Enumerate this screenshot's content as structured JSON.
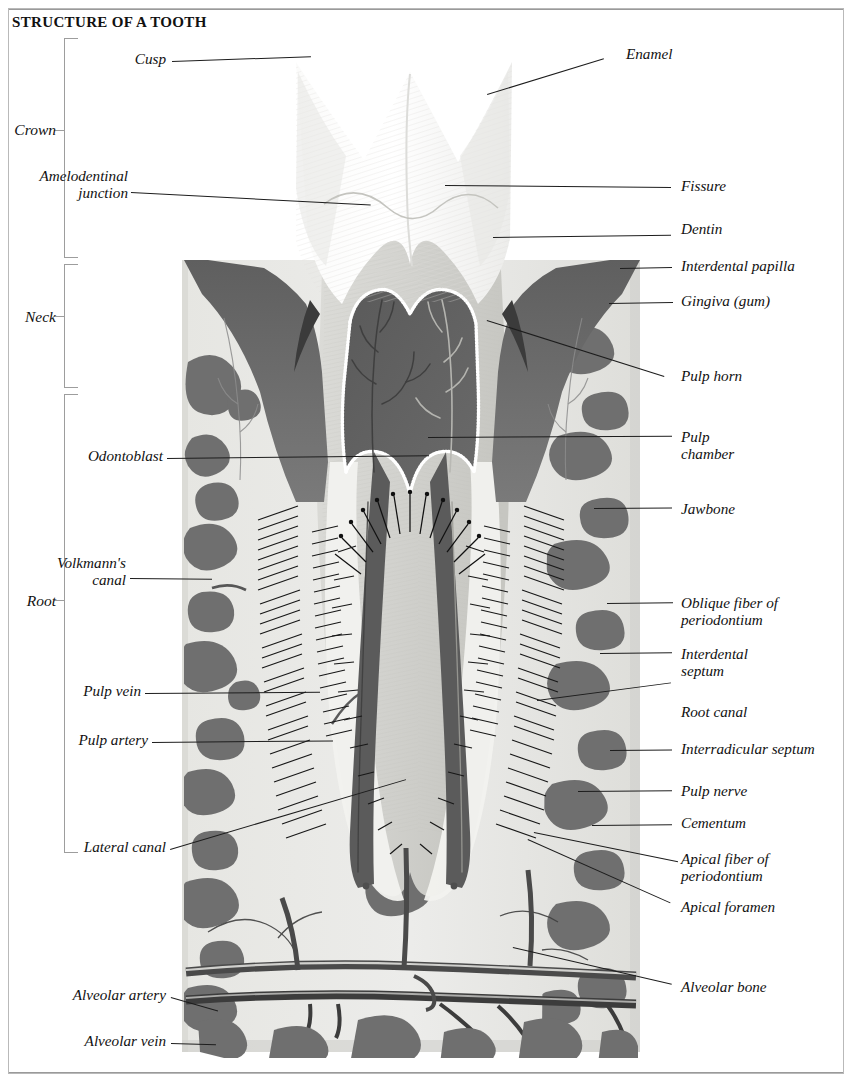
{
  "title": "STRUCTURE OF A TOOTH",
  "regions": [
    {
      "name": "region-crown",
      "label": "Crown"
    },
    {
      "name": "region-neck",
      "label": "Neck"
    },
    {
      "name": "region-root",
      "label": "Root"
    }
  ],
  "labels_left": [
    {
      "name": "label-cusp",
      "text": "Cusp"
    },
    {
      "name": "label-amelodentinal-junction",
      "text": "Amelodentinal",
      "text2": "junction"
    },
    {
      "name": "label-odontoblast",
      "text": "Odontoblast"
    },
    {
      "name": "label-volkmanns-canal",
      "text": "Volkmann's",
      "text2": "canal"
    },
    {
      "name": "label-pulp-vein",
      "text": "Pulp vein"
    },
    {
      "name": "label-pulp-artery",
      "text": "Pulp artery"
    },
    {
      "name": "label-lateral-canal",
      "text": "Lateral canal"
    },
    {
      "name": "label-alveolar-artery",
      "text": "Alveolar artery"
    },
    {
      "name": "label-alveolar-vein",
      "text": "Alveolar vein"
    }
  ],
  "labels_right": [
    {
      "name": "label-enamel",
      "text": "Enamel"
    },
    {
      "name": "label-fissure",
      "text": "Fissure"
    },
    {
      "name": "label-dentin",
      "text": "Dentin"
    },
    {
      "name": "label-interdental-papilla",
      "text": "Interdental papilla"
    },
    {
      "name": "label-gingiva",
      "text": "Gingiva (gum)"
    },
    {
      "name": "label-pulp-horn",
      "text": "Pulp horn"
    },
    {
      "name": "label-pulp-chamber",
      "text": "Pulp",
      "text2": "chamber"
    },
    {
      "name": "label-jawbone",
      "text": "Jawbone"
    },
    {
      "name": "label-oblique-fiber",
      "text": "Oblique fiber of",
      "text2": "periodontium"
    },
    {
      "name": "label-interdental-septum",
      "text": "Interdental",
      "text2": "septum"
    },
    {
      "name": "label-root-canal",
      "text": "Root canal"
    },
    {
      "name": "label-interradicular-septum",
      "text": "Interradicular septum"
    },
    {
      "name": "label-pulp-nerve",
      "text": "Pulp nerve"
    },
    {
      "name": "label-cementum",
      "text": "Cementum"
    },
    {
      "name": "label-apical-fiber",
      "text": "Apical fiber of",
      "text2": "periodontium"
    },
    {
      "name": "label-apical-foramen",
      "text": "Apical foramen"
    },
    {
      "name": "label-alveolar-bone",
      "text": "Alveolar bone"
    }
  ],
  "colors": {
    "enamel": "#f7f7f5",
    "enamel_shade": "#e9e9e6",
    "dentin": "#d8d8d4",
    "dentin_dark": "#c9c9c4",
    "gingiva": "#6e6e6e",
    "pulp": "#5f5f5f",
    "bone_marrow": "#6b6b6b",
    "bone_light": "#e2e2de",
    "vessel_dark": "#4a4a4a",
    "cementum": "#eeeeea",
    "leader": "#1d1d1d",
    "bracket": "#9d9d9d"
  }
}
